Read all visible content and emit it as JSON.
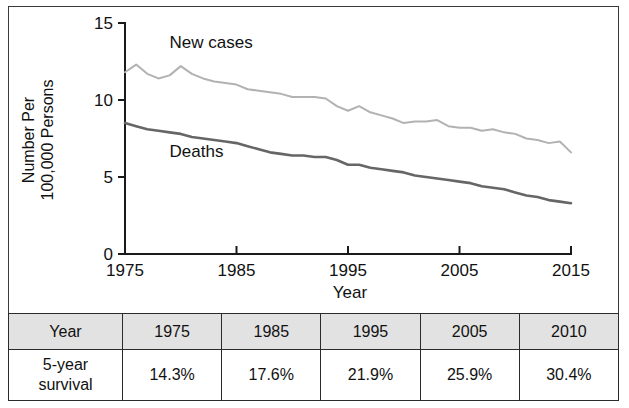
{
  "chart_data": {
    "type": "line",
    "title": "",
    "xlabel": "Year",
    "ylabel": "Number Per 100,000 Persons",
    "xlim": [
      1975,
      2015
    ],
    "ylim": [
      0,
      15
    ],
    "grid": false,
    "legend": "inline-labels",
    "y_ticks": [
      "0",
      "5",
      "10",
      "15"
    ],
    "y_tick_values": [
      0,
      5,
      10,
      15
    ],
    "x_ticks": [
      "1975",
      "1985",
      "1995",
      "2005",
      "2015"
    ],
    "x_tick_values": [
      1975,
      1985,
      1995,
      2005,
      2015
    ],
    "x": [
      1975,
      1976,
      1977,
      1978,
      1979,
      1980,
      1981,
      1982,
      1983,
      1984,
      1985,
      1986,
      1987,
      1988,
      1989,
      1990,
      1991,
      1992,
      1993,
      1994,
      1995,
      1996,
      1997,
      1998,
      1999,
      2000,
      2001,
      2002,
      2003,
      2004,
      2005,
      2006,
      2007,
      2008,
      2009,
      2010,
      2011,
      2012,
      2013,
      2014,
      2015
    ],
    "series": [
      {
        "name": "New cases",
        "color": "#b2b2b2",
        "width": 2.0,
        "label_x": 1979,
        "label_y": 13.4,
        "values": [
          11.8,
          12.3,
          11.7,
          11.4,
          11.6,
          12.2,
          11.7,
          11.4,
          11.2,
          11.1,
          11.0,
          10.7,
          10.6,
          10.5,
          10.4,
          10.2,
          10.2,
          10.2,
          10.1,
          9.6,
          9.3,
          9.6,
          9.2,
          9.0,
          8.8,
          8.5,
          8.6,
          8.6,
          8.7,
          8.3,
          8.2,
          8.2,
          8.0,
          8.1,
          7.9,
          7.8,
          7.5,
          7.4,
          7.2,
          7.3,
          6.6
        ]
      },
      {
        "name": "Deaths",
        "color": "#666666",
        "width": 2.6,
        "label_x": 1979,
        "label_y": 6.3,
        "values": [
          8.5,
          8.3,
          8.1,
          8.0,
          7.9,
          7.8,
          7.6,
          7.5,
          7.4,
          7.3,
          7.2,
          7.0,
          6.8,
          6.6,
          6.5,
          6.4,
          6.4,
          6.3,
          6.3,
          6.1,
          5.8,
          5.8,
          5.6,
          5.5,
          5.4,
          5.3,
          5.1,
          5.0,
          4.9,
          4.8,
          4.7,
          4.6,
          4.4,
          4.3,
          4.2,
          4.0,
          3.8,
          3.7,
          3.5,
          3.4,
          3.3
        ]
      }
    ]
  },
  "table": {
    "header": [
      "Year",
      "1975",
      "1985",
      "1995",
      "2005",
      "2010"
    ],
    "rows": [
      {
        "label": "5-year survival",
        "label_line1": "5-year",
        "label_line2": "survival",
        "values": [
          "14.3%",
          "17.6%",
          "21.9%",
          "25.9%",
          "30.4%"
        ]
      }
    ]
  },
  "colors": {
    "new_cases": "#b2b2b2",
    "deaths": "#666666",
    "header_fill": "#e2e2e2",
    "axis": "#1a1a1a",
    "frame": "#3a3a3a"
  }
}
